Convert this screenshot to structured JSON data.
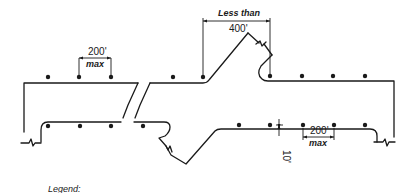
{
  "diagram": {
    "labels": {
      "top_left_spacing_value": "200'",
      "top_left_spacing_qualifier": "max",
      "crossover_spacing_qualifier": "Less than",
      "crossover_spacing_value": "400'",
      "bottom_right_spacing_value": "200'",
      "bottom_right_spacing_qualifier": "max",
      "offset_value": "10'",
      "legend_title": "Legend:"
    },
    "elements": {
      "upper_roadway_lights": 7,
      "lower_roadway_lights": 9,
      "break_symbols": 6
    }
  }
}
